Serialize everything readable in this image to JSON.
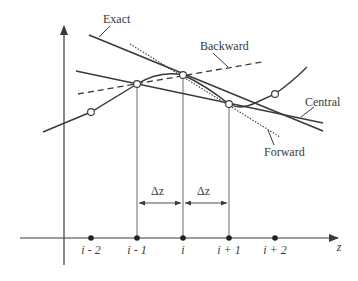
{
  "diagram": {
    "labels": {
      "exact": "Exact",
      "backward": "Backward",
      "central": "Central",
      "forward": "Forward",
      "delta_left": "Δz",
      "delta_right": "Δz",
      "axis_z": "z"
    },
    "ticks": [
      {
        "label": "i - 2",
        "x": 91
      },
      {
        "label": "i - 1",
        "x": 137
      },
      {
        "label": "i",
        "x": 183
      },
      {
        "label": "i + 1",
        "x": 229
      },
      {
        "label": "i + 2",
        "x": 275
      }
    ],
    "nodes": [
      {
        "name": "node-i-minus-2",
        "x": 91,
        "y": 112
      },
      {
        "name": "node-i-minus-1",
        "x": 137,
        "y": 84
      },
      {
        "name": "node-i",
        "x": 183,
        "y": 75
      },
      {
        "name": "node-i-plus-1",
        "x": 229,
        "y": 104
      },
      {
        "name": "node-i-plus-2",
        "x": 275,
        "y": 94
      }
    ],
    "colors": {
      "line": "#3a3a3a",
      "grid": "#6a6a6a"
    }
  }
}
